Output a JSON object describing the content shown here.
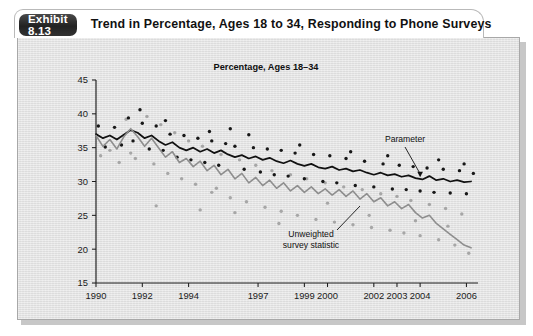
{
  "header": {
    "badge_label": "Exhibit 8.13",
    "title": "Trend in Percentage, Ages 18 to 34, Responding to Phone Surveys"
  },
  "chart_data": {
    "type": "line",
    "title": "Percentage, Ages 18–34",
    "xlabel": "",
    "ylabel": "",
    "xlim": [
      1990,
      2006.5
    ],
    "ylim": [
      15,
      45
    ],
    "grid": false,
    "legend_position": "inline-annotations",
    "y_ticks": [
      15,
      20,
      25,
      30,
      35,
      40,
      45
    ],
    "y_tick_labels": [
      "15",
      "20",
      "25",
      "30",
      "35",
      "40",
      "45"
    ],
    "x_ticks": [
      1990,
      1992,
      1994,
      1997,
      1999,
      2000,
      2002,
      2003,
      2004,
      2006
    ],
    "x_tick_labels": [
      "1990",
      "1992",
      "1994",
      "1997",
      "1999",
      "2000",
      "2002",
      "2003",
      "2004",
      "2006"
    ],
    "annotations": [
      {
        "text": "Parameter",
        "target_series": "Parameter",
        "x": 2004.0,
        "y": 30.4
      },
      {
        "text": "Unweighted survey statistic",
        "target_series": "Unweighted survey statistic",
        "x": 2003.6,
        "y": 26.0
      }
    ],
    "series": [
      {
        "name": "Parameter",
        "color": "#111111",
        "style": "solid-dark",
        "x": [
          1990.0,
          1990.3,
          1990.6,
          1990.9,
          1991.2,
          1991.5,
          1991.8,
          1992.1,
          1992.4,
          1992.7,
          1993.0,
          1993.3,
          1993.6,
          1993.9,
          1994.2,
          1994.5,
          1994.8,
          1995.1,
          1995.4,
          1995.7,
          1996.0,
          1996.3,
          1996.6,
          1996.9,
          1997.2,
          1997.5,
          1997.8,
          1998.1,
          1998.4,
          1998.7,
          1999.0,
          1999.3,
          1999.6,
          1999.9,
          2000.2,
          2000.5,
          2000.8,
          2001.1,
          2001.4,
          2001.7,
          2002.0,
          2002.3,
          2002.6,
          2002.9,
          2003.2,
          2003.5,
          2003.8,
          2004.1,
          2004.4,
          2004.7,
          2005.0,
          2005.3,
          2005.6,
          2005.9,
          2006.2
        ],
        "y": [
          37.0,
          36.4,
          36.8,
          36.2,
          36.9,
          37.6,
          37.2,
          36.4,
          36.8,
          36.0,
          35.4,
          35.8,
          35.0,
          34.6,
          35.0,
          34.4,
          34.8,
          34.2,
          34.6,
          34.0,
          33.6,
          33.9,
          33.4,
          33.7,
          33.2,
          33.5,
          33.0,
          32.7,
          33.1,
          32.6,
          32.3,
          32.6,
          32.1,
          31.9,
          32.2,
          31.7,
          31.9,
          31.5,
          31.7,
          31.3,
          31.0,
          31.3,
          30.9,
          31.1,
          30.7,
          30.9,
          30.5,
          30.3,
          30.8,
          30.2,
          30.4,
          30.0,
          30.2,
          29.9,
          30.0
        ]
      },
      {
        "name": "Unweighted survey statistic",
        "color": "#8e8e8e",
        "style": "solid-gray",
        "x": [
          1990.0,
          1990.3,
          1990.6,
          1990.9,
          1991.2,
          1991.5,
          1991.8,
          1992.1,
          1992.4,
          1992.7,
          1993.0,
          1993.3,
          1993.6,
          1993.9,
          1994.2,
          1994.5,
          1994.8,
          1995.1,
          1995.4,
          1995.7,
          1996.0,
          1996.3,
          1996.6,
          1996.9,
          1997.2,
          1997.5,
          1997.8,
          1998.1,
          1998.4,
          1998.7,
          1999.0,
          1999.3,
          1999.6,
          1999.9,
          2000.2,
          2000.5,
          2000.8,
          2001.1,
          2001.4,
          2001.7,
          2002.0,
          2002.3,
          2002.6,
          2002.9,
          2003.2,
          2003.5,
          2003.8,
          2004.1,
          2004.4,
          2004.7,
          2005.0,
          2005.3,
          2005.6,
          2005.9,
          2006.2
        ],
        "y": [
          36.8,
          35.2,
          36.2,
          34.8,
          36.6,
          37.8,
          36.6,
          35.2,
          36.4,
          35.0,
          33.6,
          34.4,
          32.8,
          33.4,
          32.2,
          33.0,
          31.6,
          32.4,
          31.0,
          31.8,
          30.4,
          31.2,
          29.8,
          30.6,
          29.4,
          30.2,
          29.0,
          29.8,
          28.6,
          29.4,
          28.4,
          29.2,
          28.2,
          28.9,
          28.0,
          28.8,
          27.8,
          28.6,
          27.4,
          28.2,
          27.0,
          27.6,
          26.4,
          27.0,
          26.0,
          26.6,
          25.4,
          24.6,
          25.0,
          23.8,
          23.0,
          22.2,
          21.4,
          20.6,
          20.2
        ]
      }
    ],
    "scatter_dark": {
      "name": "Parameter observations",
      "color": "#171717",
      "x": [
        1990.1,
        1990.4,
        1990.8,
        1991.1,
        1991.4,
        1991.6,
        1992.0,
        1992.3,
        1992.6,
        1992.9,
        1993.2,
        1993.5,
        1993.8,
        1994.1,
        1994.4,
        1994.7,
        1995.0,
        1995.3,
        1995.6,
        1996.0,
        1996.4,
        1996.8,
        1997.1,
        1997.4,
        1997.7,
        1998.0,
        1998.3,
        1998.6,
        1999.0,
        1999.4,
        1999.8,
        2000.1,
        2000.4,
        2000.8,
        2001.2,
        2001.6,
        2002.0,
        2002.4,
        2002.8,
        2003.1,
        2003.4,
        2003.7,
        2004.0,
        2004.3,
        2004.6,
        2005.0,
        2005.3,
        2005.7,
        2006.0,
        2006.3,
        1991.9,
        1993.0,
        1994.9,
        1996.6,
        1998.8,
        2001.0,
        2002.6,
        2004.8,
        2005.9,
        1995.8
      ],
      "y": [
        38.2,
        35.1,
        38.0,
        35.4,
        39.4,
        36.0,
        38.6,
        34.8,
        38.2,
        34.6,
        37.0,
        33.6,
        36.8,
        33.2,
        36.4,
        32.8,
        36.0,
        32.4,
        35.6,
        35.2,
        31.8,
        35.0,
        31.4,
        34.8,
        31.0,
        34.6,
        30.8,
        34.2,
        30.4,
        34.0,
        30.0,
        33.8,
        29.8,
        33.4,
        29.4,
        33.0,
        29.2,
        32.6,
        28.9,
        32.4,
        28.8,
        32.2,
        28.6,
        32.0,
        28.4,
        31.8,
        28.3,
        31.6,
        28.2,
        31.2,
        40.6,
        39.0,
        37.4,
        36.9,
        35.4,
        34.4,
        33.8,
        33.2,
        32.6,
        37.8
      ]
    },
    "scatter_light": {
      "name": "Survey observations",
      "color": "#a6a6a6",
      "x": [
        1990.2,
        1990.6,
        1991.0,
        1991.3,
        1991.7,
        1992.2,
        1992.5,
        1992.8,
        1993.1,
        1993.4,
        1993.7,
        1994.0,
        1994.3,
        1994.6,
        1995.0,
        1995.4,
        1995.8,
        1996.2,
        1996.5,
        1996.9,
        1997.3,
        1997.6,
        1998.0,
        1998.4,
        1998.7,
        1999.1,
        1999.5,
        1999.9,
        2000.3,
        2000.7,
        2001.1,
        2001.5,
        2001.9,
        2002.3,
        2002.7,
        2003.0,
        2003.3,
        2003.6,
        2004.0,
        2004.4,
        2004.8,
        2005.1,
        2005.5,
        2005.8,
        2006.1,
        1992.6,
        1994.5,
        1996.0,
        1997.9,
        2000.0,
        2001.8,
        2003.8,
        2005.2,
        1991.5,
        1995.2
      ],
      "y": [
        33.8,
        34.6,
        32.8,
        39.2,
        33.4,
        39.6,
        32.6,
        38.4,
        31.2,
        37.2,
        30.4,
        36.0,
        29.6,
        35.2,
        28.4,
        34.0,
        27.6,
        33.2,
        27.0,
        32.4,
        26.2,
        31.6,
        25.6,
        31.0,
        25.0,
        30.4,
        24.4,
        29.8,
        24.0,
        29.2,
        23.6,
        28.8,
        23.2,
        28.2,
        22.8,
        27.8,
        22.4,
        27.2,
        22.0,
        26.6,
        21.4,
        26.0,
        20.6,
        25.2,
        19.4,
        26.4,
        25.8,
        25.4,
        23.8,
        26.8,
        25.0,
        24.2,
        23.4,
        34.2,
        29.0
      ]
    }
  }
}
